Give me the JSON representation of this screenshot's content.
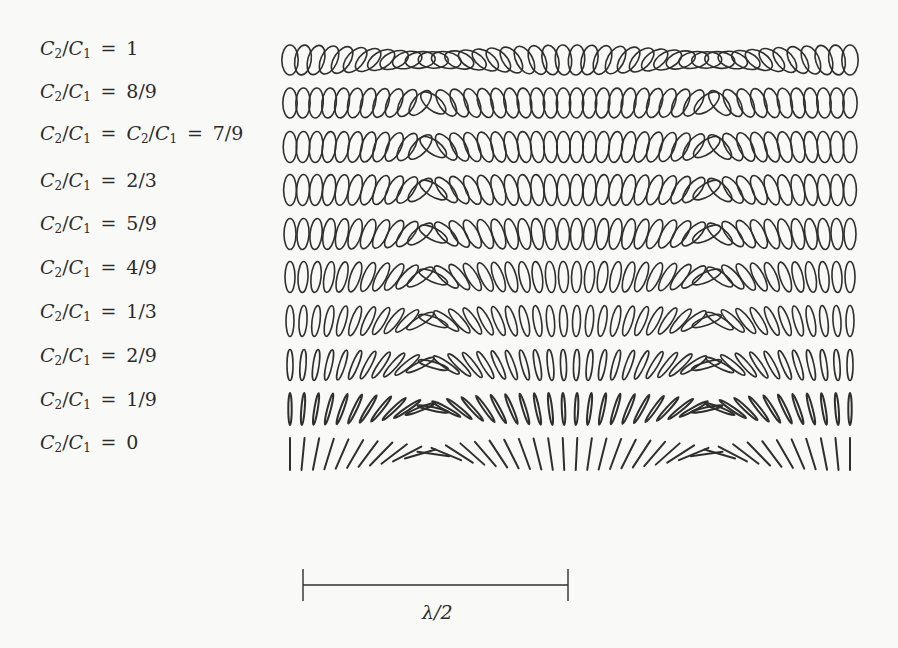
{
  "figure": {
    "rows": [
      {
        "label_prefix": "C2/C1 = ",
        "label_value": "1",
        "label": "C2/C1 = 1",
        "ratio": 1.0,
        "rx": 8.2,
        "ry": 15,
        "y_center": 60,
        "label_y": 37,
        "twist": 0.0
      },
      {
        "label_prefix": "C2/C1 = ",
        "label_value": "8/9",
        "label": "C2/C1 = 8/9",
        "ratio": 0.889,
        "rx": 7.2,
        "ry": 15,
        "y_center": 103,
        "label_y": 80,
        "twist": 1.6
      },
      {
        "label_prefix": "C2/C1 = C2/C1 = ",
        "label_value": "7/9",
        "label": "C2/C1 = C2/C1 = 7/9",
        "ratio": 0.778,
        "rx": 6.8,
        "ry": 15.5,
        "y_center": 147,
        "label_y": 122,
        "twist": 1.4
      },
      {
        "label_prefix": "C2/C1 = ",
        "label_value": "2/3",
        "label": "C2/C1 = 2/3",
        "ratio": 0.667,
        "rx": 6.4,
        "ry": 15.5,
        "y_center": 190,
        "label_y": 169,
        "twist": 1.2
      },
      {
        "label_prefix": "C2/C1 = ",
        "label_value": "5/9",
        "label": "C2/C1 = 5/9",
        "ratio": 0.556,
        "rx": 6.0,
        "ry": 15.5,
        "y_center": 234,
        "label_y": 212,
        "twist": 1.0
      },
      {
        "label_prefix": "C2/C1 = ",
        "label_value": "4/9",
        "label": "C2/C1 = 4/9",
        "ratio": 0.444,
        "rx": 5.0,
        "ry": 15.5,
        "y_center": 277,
        "label_y": 256,
        "twist": 0.85
      },
      {
        "label_prefix": "C2/C1 = ",
        "label_value": "1/3",
        "label": "C2/C1 = 1/3",
        "ratio": 0.333,
        "rx": 4.0,
        "ry": 15.5,
        "y_center": 321,
        "label_y": 300,
        "twist": 0.7
      },
      {
        "label_prefix": "C2/C1 = ",
        "label_value": "2/9",
        "label": "C2/C1 = 2/9",
        "ratio": 0.222,
        "rx": 3.0,
        "ry": 15.5,
        "y_center": 365,
        "label_y": 344,
        "twist": 0.55
      },
      {
        "label_prefix": "C2/C1 = ",
        "label_value": "1/9",
        "label": "C2/C1 = 1/9",
        "ratio": 0.111,
        "rx": 1.7,
        "ry": 16,
        "y_center": 409,
        "label_y": 388,
        "twist": 0.4
      },
      {
        "label_prefix": "C2/C1 = ",
        "label_value": "0",
        "label": "C2/C1 = 0",
        "ratio": 0.0,
        "rx": 0.0,
        "ry": 16,
        "y_center": 454,
        "label_y": 431,
        "twist": 0.25
      }
    ],
    "row_layout": {
      "x_start": 290,
      "x_end": 850,
      "count": 44,
      "period_px": 280,
      "first_vertical_x": 290,
      "stroke_color": "#2f2f2f",
      "stroke_width": 1.6
    },
    "scale_bar": {
      "label": "λ/2",
      "x1": 303,
      "x2": 568,
      "y": 585,
      "tick_half_height": 16
    }
  },
  "chart_data": {
    "type": "diagram",
    "title": "",
    "series": [
      {
        "name": "C2/C1 = 1",
        "ratio": 1.0
      },
      {
        "name": "C2/C1 = 8/9",
        "ratio": 0.889
      },
      {
        "name": "C2/C1 = C2/C1 = 7/9",
        "ratio": 0.778
      },
      {
        "name": "C2/C1 = 2/3",
        "ratio": 0.667
      },
      {
        "name": "C2/C1 = 5/9",
        "ratio": 0.556
      },
      {
        "name": "C2/C1 = 4/9",
        "ratio": 0.444
      },
      {
        "name": "C2/C1 = 1/3",
        "ratio": 0.333
      },
      {
        "name": "C2/C1 = 2/9",
        "ratio": 0.222
      },
      {
        "name": "C2/C1 = 1/9",
        "ratio": 0.111
      },
      {
        "name": "C2/C1 = 0",
        "ratio": 0.0
      }
    ],
    "elements_per_row": 44,
    "orientation_period": "λ/2 (vertical → horizontal → vertical)",
    "scale_bar_label": "λ/2",
    "grid": false,
    "legend": "row labels at left"
  }
}
